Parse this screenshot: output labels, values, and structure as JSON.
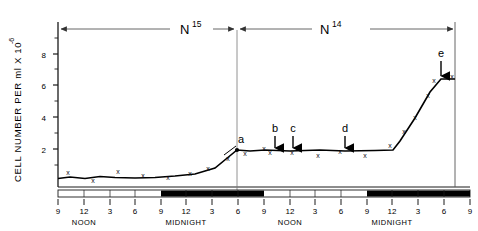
{
  "figure": {
    "title": "",
    "y_axis_label": "CELL NUMBER PER ml X 10",
    "y_axis_label_exponent": "-6",
    "phase_left_base": "N",
    "phase_left_sup": "15",
    "phase_right_base": "N",
    "phase_right_sup": "14",
    "period_noon": "NOON",
    "period_midnight": "MIDNIGHT",
    "markers": [
      {
        "id": "a",
        "label": "a",
        "x_hour": 7,
        "y_value": 1.85
      },
      {
        "id": "b",
        "label": "b",
        "x_hour": 13.5,
        "y_value": 1.85
      },
      {
        "id": "c",
        "label": "c",
        "x_hour": 15.5,
        "y_value": 1.9
      },
      {
        "id": "d",
        "label": "d",
        "x_hour": 21,
        "y_value": 1.85
      },
      {
        "id": "e",
        "label": "e",
        "x_hour": 32,
        "y_value": 6.8
      }
    ],
    "colors": {
      "line": "#000000",
      "axis": "#1a1a1a",
      "arrow": "#555555",
      "dark_band": "#000000",
      "light_band": "#ffffff",
      "background": "#ffffff"
    }
  },
  "chart_data": {
    "type": "line",
    "title": "",
    "xlabel": "",
    "ylabel": "CELL NUMBER PER ml X 10^-6",
    "ylim": [
      0,
      9
    ],
    "yticks": [
      2,
      4,
      6,
      8
    ],
    "ytick_labels": [
      "2",
      "4",
      "6",
      "8"
    ],
    "grid": false,
    "legend": "none",
    "xlim": [
      0,
      48
    ],
    "xticks": [
      0,
      3,
      6,
      9,
      12,
      15,
      18,
      21,
      24,
      27,
      30,
      33,
      36,
      39,
      42,
      45,
      48
    ],
    "xtick_labels": [
      "9",
      "12",
      "3",
      "6",
      "9",
      "12",
      "3",
      "6",
      "9",
      "12",
      "3",
      "6",
      "9",
      "12",
      "3",
      "6",
      "9"
    ],
    "x_period_markers": [
      {
        "label": "NOON",
        "x_hour": 3
      },
      {
        "label": "MIDNIGHT",
        "x_hour": 15
      },
      {
        "label": "NOON",
        "x_hour": 27
      },
      {
        "label": "MIDNIGHT",
        "x_hour": 39
      }
    ],
    "dark_bands": [
      {
        "start_hour": 12,
        "end_hour": 24
      },
      {
        "start_hour": 36,
        "end_hour": 48
      }
    ],
    "phase_divider_hour": 22,
    "series": [
      {
        "name": "cell number",
        "x": [
          0,
          1.5,
          3,
          4.5,
          6,
          7.5,
          9,
          10.5,
          12,
          13.5,
          15,
          16.5,
          18,
          19.5,
          21,
          22,
          24,
          25.5,
          27,
          28.5,
          30,
          31.5,
          33,
          34.5,
          36,
          37.5,
          39,
          40.5,
          42,
          43.5,
          45,
          46.5,
          48
        ],
        "y": [
          0.62,
          0.72,
          0.55,
          0.78,
          0.7,
          0.6,
          0.58,
          0.78,
          1.05,
          1.85,
          1.65,
          1.9,
          1.85,
          1.9,
          1.85,
          1.7,
          1.85,
          1.78,
          1.85,
          1.9,
          2.6,
          3.05,
          4.2,
          5.3,
          6.3,
          6.8,
          6.8,
          6.8,
          6.8,
          6.8,
          6.8,
          6.8,
          6.8
        ]
      }
    ],
    "polyline_vertices": [
      {
        "x_hour": 0,
        "y": 0.62
      },
      {
        "x_hour": 12,
        "y": 0.7
      },
      {
        "x_hour": 14.2,
        "y": 1.2
      },
      {
        "x_hour": 22,
        "y": 1.85
      },
      {
        "x_hour": 38,
        "y": 1.85
      },
      {
        "x_hour": 40.5,
        "y": 3.3
      },
      {
        "x_hour": 45.5,
        "y": 6.8
      },
      {
        "x_hour": 48,
        "y": 6.8
      }
    ],
    "data_point_marker": "x"
  }
}
